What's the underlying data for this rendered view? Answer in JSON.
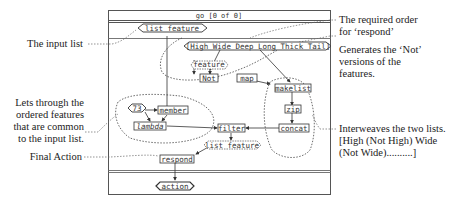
{
  "frame": {
    "title": "go [0 of 0]"
  },
  "nodes": {
    "input_list": "list feature",
    "order_list": "[High Wide Deep Long Thick Tail]",
    "feature": "feature",
    "not": "Not",
    "map": "map",
    "makelist": "makelist",
    "zip": "zip",
    "concat": "concat",
    "const_73": "73",
    "member": "member",
    "lambda": "lambda",
    "filter": "filter",
    "output_list": "list feature",
    "respond": "respond",
    "action": "action"
  },
  "annotations": {
    "input_list": "The input list",
    "lets_through": [
      "Lets through the",
      "ordered features",
      "that are common",
      "to the input list."
    ],
    "final_action": "Final Action",
    "required_order": [
      "The required order",
      "for ‘respond’"
    ],
    "generates_not": [
      "Generates the ‘Not’",
      "versions of the",
      "features."
    ],
    "interweaves": [
      "Interweaves the two lists.",
      "[High (Not High) Wide",
      "(Not Wide)..........]"
    ]
  }
}
